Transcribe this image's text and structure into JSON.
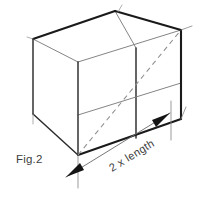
{
  "figure": {
    "caption": "Fig.2",
    "dimension_label": "2 x length",
    "background_color": "#ffffff",
    "line_color_strong": "#1a1a1a",
    "line_color_light": "#7d7d7d",
    "dashed_color": "#8e8e8e",
    "text_color": "#3d3d3d"
  },
  "geometry": {
    "description": "Rectangular box drawn in isometric projection, subdivided into two equal cube halves, with a dashed space diagonal and a dimension line beneath the front-lower-right edge.",
    "vertices": {
      "top_back_left": "33,39",
      "top_back_right": "115,11",
      "top_front_right": "181,30",
      "top_front_left": "78,62",
      "bottom_front_left": "20,132",
      "bottom_front_center": "78,155",
      "bottom_front_right": "181,119",
      "divider_top": "115,11",
      "divider_bottom": "136,84"
    },
    "dimension": {
      "from": "63,178",
      "to": "175,115",
      "arrow_start_label": "arrowhead-left",
      "arrow_end_label": "arrowhead-right"
    }
  }
}
